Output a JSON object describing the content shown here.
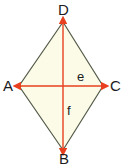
{
  "figure": {
    "name": "rhombus-with-diagonals",
    "canvas": {
      "width": 125,
      "height": 168,
      "background": "#ffffff"
    },
    "shape": {
      "type": "rhombus",
      "fill": "#fbfbe8",
      "stroke": "#555c4a",
      "stroke_width": 1.2,
      "vertices": [
        {
          "label": "D",
          "x": 63,
          "y": 22,
          "position": "top"
        },
        {
          "label": "C",
          "x": 103,
          "y": 86,
          "position": "right"
        },
        {
          "label": "B",
          "x": 63,
          "y": 150,
          "position": "bottom"
        },
        {
          "label": "A",
          "x": 19,
          "y": 86,
          "position": "left"
        }
      ]
    },
    "diagonals": [
      {
        "name": "horizontal-diagonal",
        "label": "e",
        "color": "#e8401f",
        "from": {
          "label": "A",
          "x": 19,
          "y": 86
        },
        "to": {
          "label": "C",
          "x": 103,
          "y": 86
        },
        "arrowheads": "both"
      },
      {
        "name": "vertical-diagonal",
        "label": "f",
        "color": "#e8401f",
        "from": {
          "label": "D",
          "x": 63,
          "y": 22
        },
        "to": {
          "label": "B",
          "x": 63,
          "y": 150
        },
        "arrowheads": "both"
      }
    ],
    "intersection": {
      "x": 63,
      "y": 86
    },
    "labels": {
      "vertex_top": "D",
      "vertex_left": "A",
      "vertex_right": "C",
      "vertex_bottom": "B",
      "diagonal_horizontal": "e",
      "diagonal_vertical": "f"
    },
    "colors": {
      "fill": "#fbfbe8",
      "edge": "#555c4a",
      "diagonal": "#e8401f",
      "text": "#1c1c1c",
      "background": "#ffffff"
    }
  }
}
